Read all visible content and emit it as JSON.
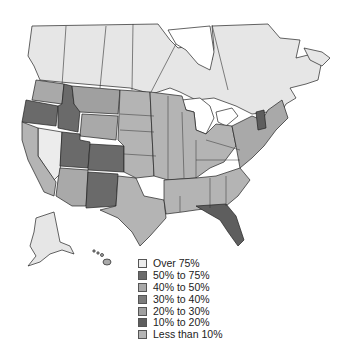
{
  "map": {
    "title": "",
    "regions_shown": [
      "Canada",
      "United States",
      "Alaska",
      "Hawaii"
    ]
  },
  "legend": {
    "items": [
      {
        "label": "Over 75%",
        "color": "#ececec"
      },
      {
        "label": "50% to 75%",
        "color": "#6a6a6a"
      },
      {
        "label": "40% to 50%",
        "color": "#a9a9a9"
      },
      {
        "label": "30% to 40%",
        "color": "#7b7b7b"
      },
      {
        "label": "20% to 30%",
        "color": "#a0a0a0"
      },
      {
        "label": "10% to 20%",
        "color": "#5e5e5e"
      },
      {
        "label": "Less than 10%",
        "color": "#b4b4b4"
      }
    ]
  },
  "colors": {
    "canada": "#e6e6e6",
    "water": "#ffffff",
    "border": "#222222"
  }
}
